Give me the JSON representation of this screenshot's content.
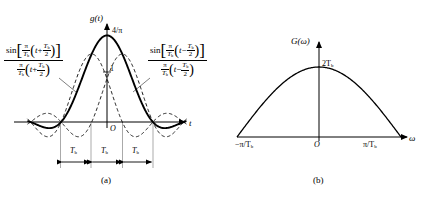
{
  "figure": {
    "background": "#ffffff",
    "ink": "#000000"
  },
  "panel_a": {
    "caption": "(a)",
    "y_axis_label": "g(t)",
    "x_axis_label": "t",
    "origin_label": "O",
    "peak_label": "4/π",
    "unit_tick_label": "1",
    "interval_labels": [
      "T",
      "T",
      "T"
    ],
    "interval_subscript": "b",
    "formula_left": {
      "sin": "sin",
      "bracket_open": "[",
      "bracket_close": "]",
      "paren_open": "(",
      "paren_close": ")",
      "pi": "π",
      "T": "T",
      "sub_b": "b",
      "t": "t",
      "sign": "+",
      "two": "2"
    },
    "formula_right": {
      "sin": "sin",
      "bracket_open": "[",
      "bracket_close": "]",
      "paren_open": "(",
      "paren_close": ")",
      "pi": "π",
      "T": "T",
      "sub_b": "b",
      "t": "t",
      "sign": "−",
      "two": "2"
    }
  },
  "panel_b": {
    "caption": "(b)",
    "y_axis_label": "G(ω)",
    "x_axis_label": "ω",
    "origin_label": "O",
    "peak_label": "2T",
    "peak_label_sub": "b",
    "left_tick_label": "−π/T",
    "left_tick_sub": "b",
    "right_tick_label": "π/T",
    "right_tick_sub": "b"
  },
  "chart_data": [
    {
      "type": "line",
      "title": "(a)",
      "xlabel": "t",
      "ylabel": "g(t)",
      "xlim": [
        -2.6,
        2.6
      ],
      "ylim": [
        -0.35,
        1.45
      ],
      "grid": false,
      "legend": "none",
      "annotations": [
        "4/π",
        "1",
        "O",
        "T_b",
        "T_b",
        "T_b"
      ],
      "series": [
        {
          "name": "g(t) = sinc(t+0.5) + sinc(t-0.5)",
          "style": "solid",
          "peak_value": 1.2732,
          "formula": "sin[(π/T_b)(t+T_b/2)]/[(π/T_b)(t+T_b/2)] + sin[(π/T_b)(t−T_b/2)]/[(π/T_b)(t−T_b/2)]"
        },
        {
          "name": "sinc(t + T_b/2)",
          "style": "dashed",
          "peak_value": 1.0,
          "peak_x": -0.5,
          "formula": "sin[(π/T_b)(t+T_b/2)]/[(π/T_b)(t+T_b/2)]"
        },
        {
          "name": "sinc(t − T_b/2)",
          "style": "dashed",
          "peak_value": 1.0,
          "peak_x": 0.5,
          "formula": "sin[(π/T_b)(t−T_b/2)]/[(π/T_b)(t−T_b/2)]"
        }
      ],
      "markers": {
        "interval_boundaries": [
          -1.5,
          -0.5,
          0.5,
          1.5
        ],
        "interval_width": 1.0,
        "interval_count": 3
      }
    },
    {
      "type": "line",
      "title": "(b)",
      "xlabel": "ω",
      "ylabel": "G(ω)",
      "xlim": [
        -1.45,
        1.45
      ],
      "ylim": [
        0,
        1.3
      ],
      "grid": false,
      "legend": "none",
      "xticks": [
        -1,
        0,
        1
      ],
      "xticklabels": [
        "−π/T_b",
        "O",
        "π/T_b"
      ],
      "annotations": [
        "2T_b"
      ],
      "series": [
        {
          "name": "G(ω) = 2T_b cos(ωT_b/2)",
          "style": "solid",
          "peak_value": 1.0,
          "peak_label": "2T_b",
          "zeros": [
            -1,
            1
          ]
        }
      ]
    }
  ]
}
